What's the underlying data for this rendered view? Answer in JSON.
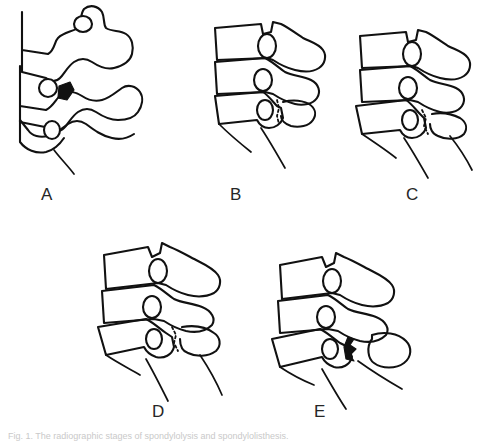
{
  "figure": {
    "background_color": "#ffffff",
    "ink_color": "#111111",
    "label_color": "#262626",
    "caption": "Fig. 1. The radiographic stages of spondylolysis and spondylolisthesis.",
    "panels": [
      {
        "id": "A",
        "label": "A",
        "title": "Oblique view Scotty dog with pars defect collar",
        "view": "oblique",
        "vertebra_count": 3,
        "defect": "pars interarticularis defect shown as dark collar",
        "slip_grade": "0"
      },
      {
        "id": "B",
        "label": "B",
        "title": "Lateral view pars defect without slip",
        "view": "lateral",
        "vertebra_count": 3,
        "defect": "lytic pars defect, posterior elements intact in line",
        "slip_grade": "0"
      },
      {
        "id": "C",
        "label": "C",
        "title": "Lateral view grade I anterolisthesis",
        "view": "lateral",
        "vertebra_count": 3,
        "defect": "pars defect with mild forward slip",
        "slip_grade": "I"
      },
      {
        "id": "D",
        "label": "D",
        "title": "Lateral view grade II anterolisthesis",
        "view": "lateral",
        "vertebra_count": 3,
        "defect": "pars defect with moderate forward slip and widened gap",
        "slip_grade": "II"
      },
      {
        "id": "E",
        "label": "E",
        "title": "Lateral view grade III anterolisthesis with detached posterior element",
        "view": "lateral",
        "vertebra_count": 3,
        "defect": "pars defect with marked forward slip, separated posterior fragment",
        "slip_grade": "III"
      }
    ]
  }
}
